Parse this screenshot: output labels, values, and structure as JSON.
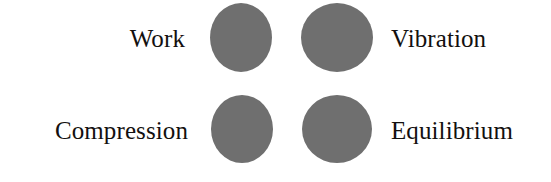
{
  "figure": {
    "background_color": "#ffffff",
    "circle_color": "#6f6f6f",
    "text_color": "#13100f",
    "layout": "2x2-grid-of-circles-with-flanking-labels"
  },
  "labels": {
    "top_left": "Work",
    "top_right": "Vibration",
    "bottom_left": "Compression",
    "bottom_right": "Equilibrium"
  },
  "nodes": [
    {
      "id": "node-top-left",
      "label": "Work",
      "label_side": "left",
      "row": 1,
      "column": 1
    },
    {
      "id": "node-top-right",
      "label": "Vibration",
      "label_side": "right",
      "row": 1,
      "column": 2
    },
    {
      "id": "node-bottom-left",
      "label": "Compression",
      "label_side": "left",
      "row": 2,
      "column": 1
    },
    {
      "id": "node-bottom-right",
      "label": "Equilibrium",
      "label_side": "right",
      "row": 2,
      "column": 2
    }
  ]
}
